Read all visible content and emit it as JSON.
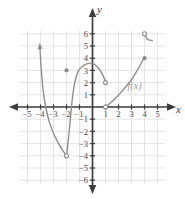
{
  "figure": {
    "background_color": "#ffffff",
    "grid_color": "#d8d8d8",
    "axis_color": "#3d3d3d",
    "curve_color": "#8c8c8c",
    "function_label": "f(x)",
    "x_axis_name": "x",
    "y_axis_name": "y"
  },
  "axes": {
    "x_ticks": [
      "-5",
      "-4",
      "-3",
      "-2",
      "-1",
      "1",
      "2",
      "3",
      "4",
      "5"
    ],
    "y_ticks": [
      "6",
      "5",
      "4",
      "3",
      "2",
      "1",
      "-1",
      "-2",
      "-3",
      "-4",
      "-5",
      "-6"
    ],
    "xlim": [
      -5.5,
      5.5
    ],
    "ylim": [
      -6.5,
      6.5
    ],
    "x_label": "x",
    "y_label": "y"
  },
  "chart_data": {
    "type": "line",
    "title": "",
    "xlabel": "x",
    "ylabel": "y",
    "xlim": [
      -5.5,
      5.5
    ],
    "ylim": [
      -6.5,
      6.5
    ],
    "grid": true,
    "legend": "none",
    "annotations": [
      {
        "text": "f(x)",
        "x": 2.7,
        "y": 1.5
      }
    ],
    "series": [
      {
        "name": "branch-left",
        "points": [
          [
            -4.05,
            5.0
          ],
          [
            -3.95,
            3.2
          ],
          [
            -3.8,
            1.4
          ],
          [
            -3.6,
            0.0
          ],
          [
            -3.3,
            -1.3
          ],
          [
            -2.9,
            -2.4
          ],
          [
            -2.5,
            -3.2
          ],
          [
            -2.2,
            -3.7
          ],
          [
            -2.0,
            -4.0
          ]
        ],
        "start_marker": "arrow",
        "end_marker": "open-circle"
      },
      {
        "name": "branch-middle",
        "points": [
          [
            -2.0,
            -4.0
          ],
          [
            -1.85,
            -2.6
          ],
          [
            -1.72,
            -1.2
          ],
          [
            -1.6,
            0.2
          ],
          [
            -1.45,
            1.5
          ],
          [
            -1.25,
            2.5
          ],
          [
            -1.0,
            3.1
          ],
          [
            -0.6,
            3.45
          ],
          [
            -0.2,
            3.6
          ],
          [
            0.15,
            3.5
          ],
          [
            0.45,
            3.2
          ],
          [
            0.7,
            2.8
          ],
          [
            0.9,
            2.35
          ],
          [
            1.0,
            2.0
          ]
        ],
        "start_marker": "none",
        "end_marker": "open-circle"
      },
      {
        "name": "branch-right",
        "points": [
          [
            1.0,
            0.0
          ],
          [
            1.4,
            0.35
          ],
          [
            1.8,
            0.75
          ],
          [
            2.2,
            1.2
          ],
          [
            2.6,
            1.7
          ],
          [
            3.0,
            2.25
          ],
          [
            3.3,
            2.75
          ],
          [
            3.6,
            3.3
          ],
          [
            3.85,
            3.8
          ],
          [
            4.0,
            4.0
          ]
        ],
        "start_marker": "open-circle",
        "end_marker": "solid-dot"
      },
      {
        "name": "hook-top-right",
        "points": [
          [
            4.0,
            6.0
          ],
          [
            4.12,
            5.7
          ],
          [
            4.3,
            5.5
          ],
          [
            4.6,
            5.45
          ]
        ],
        "start_marker": "open-circle",
        "end_marker": "none"
      }
    ],
    "points": [
      {
        "name": "isolated-solid-point",
        "x": -2,
        "y": 3,
        "style": "solid"
      },
      {
        "name": "open-endpoint-left",
        "x": -2,
        "y": -4,
        "style": "open"
      },
      {
        "name": "open-endpoint-middle",
        "x": 1,
        "y": 2,
        "style": "open"
      },
      {
        "name": "open-endpoint-right",
        "x": 1,
        "y": 0,
        "style": "open"
      },
      {
        "name": "solid-endpoint-right",
        "x": 4,
        "y": 4,
        "style": "solid"
      },
      {
        "name": "open-point-top",
        "x": 4,
        "y": 6,
        "style": "open"
      }
    ]
  }
}
